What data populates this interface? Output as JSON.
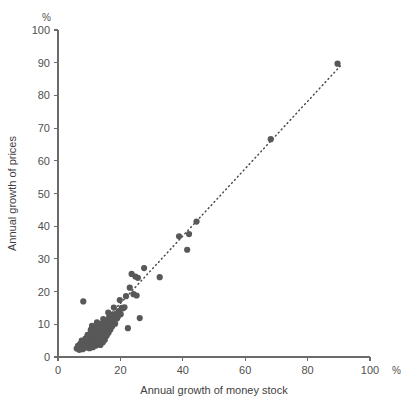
{
  "chart_data": {
    "type": "scatter",
    "title": "",
    "xlabel": "Annual growth of money stock",
    "ylabel": "Annual growth of prices",
    "x_unit": "%",
    "y_unit": "%",
    "xlim": [
      0,
      100
    ],
    "ylim": [
      0,
      100
    ],
    "xticks": [
      0,
      20,
      40,
      60,
      80,
      100
    ],
    "yticks": [
      0,
      10,
      20,
      30,
      40,
      50,
      60,
      70,
      80,
      90,
      100
    ],
    "xtick_labels": [
      "0",
      "20",
      "40",
      "60",
      "80",
      "100"
    ],
    "ytick_labels": [
      "0",
      "10",
      "20",
      "30",
      "40",
      "50",
      "60",
      "70",
      "80",
      "90",
      "100"
    ],
    "grid": false,
    "legend": null,
    "series": [
      {
        "name": "Countries",
        "marker": "filled-circle",
        "color": "#585858",
        "points": [
          [
            6.0,
            2.6
          ],
          [
            6.4,
            3.4
          ],
          [
            6.8,
            2.2
          ],
          [
            7.1,
            4.0
          ],
          [
            7.4,
            3.1
          ],
          [
            7.6,
            5.0
          ],
          [
            7.9,
            2.4
          ],
          [
            8.1,
            17.0
          ],
          [
            8.3,
            4.4
          ],
          [
            8.6,
            3.6
          ],
          [
            8.8,
            5.6
          ],
          [
            9.0,
            2.9
          ],
          [
            9.2,
            4.8
          ],
          [
            9.4,
            6.2
          ],
          [
            9.6,
            3.8
          ],
          [
            9.8,
            5.2
          ],
          [
            10.0,
            4.2
          ],
          [
            10.2,
            7.0
          ],
          [
            10.4,
            3.3
          ],
          [
            10.6,
            5.8
          ],
          [
            10.8,
            4.6
          ],
          [
            11.0,
            6.6
          ],
          [
            11.2,
            3.0
          ],
          [
            11.4,
            8.0
          ],
          [
            11.6,
            5.4
          ],
          [
            11.8,
            4.1
          ],
          [
            12.0,
            6.9
          ],
          [
            12.2,
            3.5
          ],
          [
            12.4,
            7.6
          ],
          [
            12.6,
            5.0
          ],
          [
            12.8,
            9.0
          ],
          [
            13.0,
            4.3
          ],
          [
            13.2,
            6.3
          ],
          [
            13.4,
            7.9
          ],
          [
            13.6,
            3.7
          ],
          [
            13.8,
            5.7
          ],
          [
            14.0,
            8.6
          ],
          [
            14.2,
            6.0
          ],
          [
            14.4,
            4.5
          ],
          [
            14.6,
            9.6
          ],
          [
            14.8,
            7.2
          ],
          [
            15.0,
            5.3
          ],
          [
            15.2,
            10.4
          ],
          [
            15.4,
            8.2
          ],
          [
            15.6,
            6.5
          ],
          [
            15.8,
            11.2
          ],
          [
            16.0,
            9.2
          ],
          [
            16.2,
            7.4
          ],
          [
            16.4,
            12.2
          ],
          [
            16.6,
            10.0
          ],
          [
            16.8,
            8.4
          ],
          [
            17.0,
            12.6
          ],
          [
            17.2,
            10.8
          ],
          [
            17.4,
            9.4
          ],
          [
            17.6,
            13.0
          ],
          [
            17.8,
            11.4
          ],
          [
            18.0,
            12.9
          ],
          [
            18.3,
            10.2
          ],
          [
            18.6,
            13.2
          ],
          [
            18.9,
            11.8
          ],
          [
            19.2,
            12.3
          ],
          [
            19.5,
            14.0
          ],
          [
            19.8,
            17.4
          ],
          [
            20.1,
            13.1
          ],
          [
            20.4,
            15.0
          ],
          [
            20.8,
            14.9
          ],
          [
            21.3,
            15.2
          ],
          [
            21.8,
            18.6
          ],
          [
            22.4,
            8.8
          ],
          [
            23.0,
            21.2
          ],
          [
            23.6,
            25.4
          ],
          [
            24.2,
            19.2
          ],
          [
            24.8,
            24.6
          ],
          [
            25.2,
            18.8
          ],
          [
            25.6,
            24.2
          ],
          [
            26.2,
            11.9
          ],
          [
            27.6,
            27.2
          ],
          [
            32.6,
            24.4
          ],
          [
            38.8,
            36.9
          ],
          [
            41.4,
            32.8
          ],
          [
            42.0,
            37.6
          ],
          [
            44.4,
            41.4
          ],
          [
            68.2,
            66.6
          ],
          [
            89.6,
            89.7
          ],
          [
            9.1,
            3.2
          ],
          [
            10.1,
            2.7
          ],
          [
            11.1,
            4.9
          ],
          [
            12.1,
            5.9
          ],
          [
            13.1,
            8.9
          ],
          [
            14.1,
            5.1
          ],
          [
            10.5,
            8.3
          ],
          [
            11.9,
            9.1
          ],
          [
            12.9,
            6.1
          ],
          [
            13.9,
            10.2
          ],
          [
            9.5,
            6.8
          ],
          [
            8.4,
            2.8
          ],
          [
            15.5,
            9.9
          ],
          [
            16.9,
            11.0
          ],
          [
            14.5,
            11.6
          ],
          [
            12.5,
            10.6
          ],
          [
            11.5,
            7.3
          ],
          [
            10.9,
            9.5
          ],
          [
            16.1,
            13.6
          ],
          [
            17.9,
            15.1
          ]
        ]
      }
    ],
    "trendline": {
      "type": "dotted",
      "from": [
        6.0,
        2.0
      ],
      "to": [
        90.5,
        89.0
      ],
      "color": "#4a4a4a"
    }
  }
}
